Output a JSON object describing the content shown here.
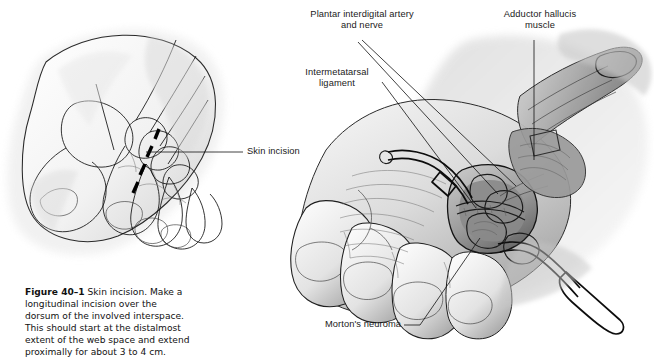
{
  "figure": {
    "number": "Figure 40–1",
    "caption_text": " Skin incision. Make a longitudinal incision over the dorsum of the involved interspace. This should start at the distalmost extent of the web space and extend proximally for about 3 to 4 cm.",
    "panels": [
      {
        "id": "left-panel",
        "name": "dorsum-line-drawing",
        "description": "Line drawing of dorsum of right foot showing metatarsals and phalanges with dashed incision marking"
      },
      {
        "id": "right-panel",
        "name": "surgical-exposure-drawing",
        "description": "Shaded drawing of operative exposure of the third intermetatarsal space with retractors"
      }
    ]
  },
  "labels": {
    "skin_incision": "Skin incision",
    "plantar_nerve": "Plantar interdigital artery\nand nerve",
    "adductor": "Adductor hallucis\nmuscle",
    "intermetatarsal": "Intermetatarsal\nligament",
    "neuroma": "Morton's neuroma"
  },
  "colors": {
    "ink": "#111111",
    "paper": "#ffffff",
    "shade_light": "#e9e9e9",
    "shade_mid": "#c2c2c2",
    "shade_dark": "#8d8d8d",
    "shade_deep": "#5a5a5a"
  }
}
